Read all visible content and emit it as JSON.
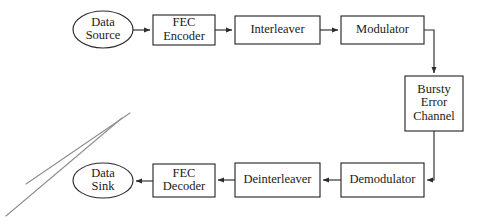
{
  "diagram": {
    "background_color": "#ffffff",
    "stroke_color": "#2b2b2b",
    "text_color": "#1a1a1a",
    "artifact_color": "#8d8d8d",
    "nodes": [
      {
        "id": "data-source",
        "shape": "ellipse",
        "lines": [
          "Data",
          "Source"
        ],
        "label": "Data Source",
        "cx": 103,
        "cy": 29.5,
        "rx": 30,
        "ry": 18.5
      },
      {
        "id": "fec-encoder",
        "shape": "rect",
        "lines": [
          "FEC",
          "Encoder"
        ],
        "label": "FEC Encoder",
        "x": 153,
        "y": 15,
        "w": 62,
        "h": 30
      },
      {
        "id": "interleaver",
        "shape": "rect",
        "lines": [
          "Interleaver"
        ],
        "label": "Interleaver",
        "x": 235,
        "y": 16,
        "w": 85,
        "h": 28
      },
      {
        "id": "modulator",
        "shape": "rect",
        "lines": [
          "Modulator"
        ],
        "label": "Modulator",
        "x": 341,
        "y": 16,
        "w": 83,
        "h": 28
      },
      {
        "id": "bursty-error-channel",
        "shape": "rect",
        "lines": [
          "Bursty",
          "Error",
          "Channel"
        ],
        "label": "Bursty Error Channel",
        "x": 405,
        "y": 76,
        "w": 58,
        "h": 55
      },
      {
        "id": "demodulator",
        "shape": "rect",
        "lines": [
          "Demodulator"
        ],
        "label": "Demodulator",
        "x": 341,
        "y": 163,
        "w": 83,
        "h": 34
      },
      {
        "id": "deinterleaver",
        "shape": "rect",
        "lines": [
          "Deinterleaver"
        ],
        "label": "Deinterleaver",
        "x": 235,
        "y": 163,
        "w": 85,
        "h": 34
      },
      {
        "id": "fec-decoder",
        "shape": "rect",
        "lines": [
          "FEC",
          "Decoder"
        ],
        "label": "FEC Decoder",
        "x": 153,
        "y": 164,
        "w": 62,
        "h": 33
      },
      {
        "id": "data-sink",
        "shape": "ellipse",
        "lines": [
          "Data",
          "Sink"
        ],
        "label": "Data Sink",
        "cx": 103,
        "cy": 180.5,
        "rx": 30,
        "ry": 17.5
      }
    ],
    "edges": [
      {
        "id": "edge-source-to-encoder",
        "from": "data-source",
        "to": "fec-encoder",
        "path": "M 133 30 L 150 30",
        "arrow": "end"
      },
      {
        "id": "edge-encoder-to-interleaver",
        "from": "fec-encoder",
        "to": "interleaver",
        "path": "M 215 30 L 232 30",
        "arrow": "end"
      },
      {
        "id": "edge-interleaver-to-modulator",
        "from": "interleaver",
        "to": "modulator",
        "path": "M 320 30 L 338 30",
        "arrow": "end"
      },
      {
        "id": "edge-modulator-to-channel",
        "from": "modulator",
        "to": "bursty-error-channel",
        "path": "M 424 30 L 434 30 L 434 73",
        "arrow": "end"
      },
      {
        "id": "edge-channel-to-demodulator",
        "from": "bursty-error-channel",
        "to": "demodulator",
        "path": "M 434 131 L 434 180 L 427 180",
        "arrow": "end"
      },
      {
        "id": "edge-demodulator-to-deinterleaver",
        "from": "demodulator",
        "to": "deinterleaver",
        "path": "M 341 180 L 323 180",
        "arrow": "end"
      },
      {
        "id": "edge-deinterleaver-to-decoder",
        "from": "deinterleaver",
        "to": "fec-decoder",
        "path": "M 235 180 L 218 180",
        "arrow": "end"
      },
      {
        "id": "edge-decoder-to-sink",
        "from": "fec-decoder",
        "to": "data-sink",
        "path": "M 153 181 L 136 181",
        "arrow": "end"
      }
    ],
    "artifacts": [
      {
        "id": "scan-artifact-line-upper",
        "x1": 26,
        "y1": 184,
        "x2": 130,
        "y2": 113
      },
      {
        "id": "scan-artifact-line-lower",
        "x1": 6,
        "y1": 216,
        "x2": 122,
        "y2": 118
      }
    ]
  }
}
